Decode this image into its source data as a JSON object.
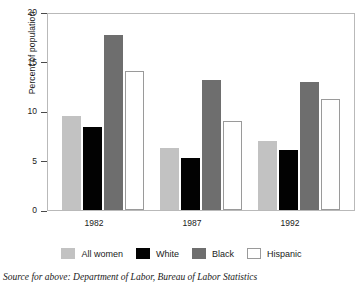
{
  "chart_data": {
    "type": "bar",
    "title": "",
    "subtitle": "",
    "xlabel": "",
    "ylabel": "Percent of population",
    "categories": [
      "1982",
      "1987",
      "1992"
    ],
    "series": [
      {
        "name": "All women",
        "color": "#c2c2c2",
        "values": [
          9.5,
          6.3,
          7.0
        ]
      },
      {
        "name": "White",
        "color": "#020202",
        "values": [
          8.4,
          5.3,
          6.1
        ]
      },
      {
        "name": "Black",
        "color": "#6e6e6e",
        "values": [
          17.8,
          13.2,
          13.0
        ]
      },
      {
        "name": "Hispanic",
        "color": "#ffffff",
        "values": [
          14.1,
          9.0,
          11.3
        ]
      }
    ],
    "ylim": [
      0,
      20
    ],
    "yticks": [
      0,
      5,
      10,
      15,
      20
    ],
    "ytick_labels": [
      "0",
      "5",
      "10",
      "15",
      "20"
    ],
    "grid": false,
    "legend_position": "bottom"
  },
  "source_note": "Source for above: Department of Labor, Bureau of Labor Statistics"
}
